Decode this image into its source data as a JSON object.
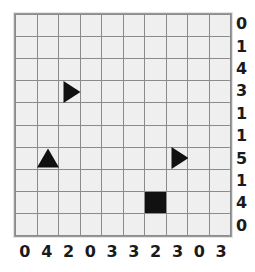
{
  "grid": {
    "rows": 10,
    "cols": 10,
    "cell_color": "#efefef",
    "line_color": "#8b8b8b",
    "shape_color": "#111111"
  },
  "axes": {
    "row_labels": [
      "0",
      "1",
      "4",
      "3",
      "1",
      "1",
      "5",
      "1",
      "4",
      "0"
    ],
    "col_labels": [
      "0",
      "4",
      "2",
      "0",
      "3",
      "3",
      "2",
      "3",
      "0",
      "3"
    ]
  },
  "shapes": [
    {
      "name": "triangle-right",
      "glyph": "triangle-right",
      "row": 3,
      "col": 2
    },
    {
      "name": "triangle-up",
      "glyph": "triangle-up",
      "row": 6,
      "col": 1
    },
    {
      "name": "triangle-right",
      "glyph": "triangle-right",
      "row": 6,
      "col": 7
    },
    {
      "name": "square",
      "glyph": "square",
      "row": 8,
      "col": 6
    }
  ]
}
